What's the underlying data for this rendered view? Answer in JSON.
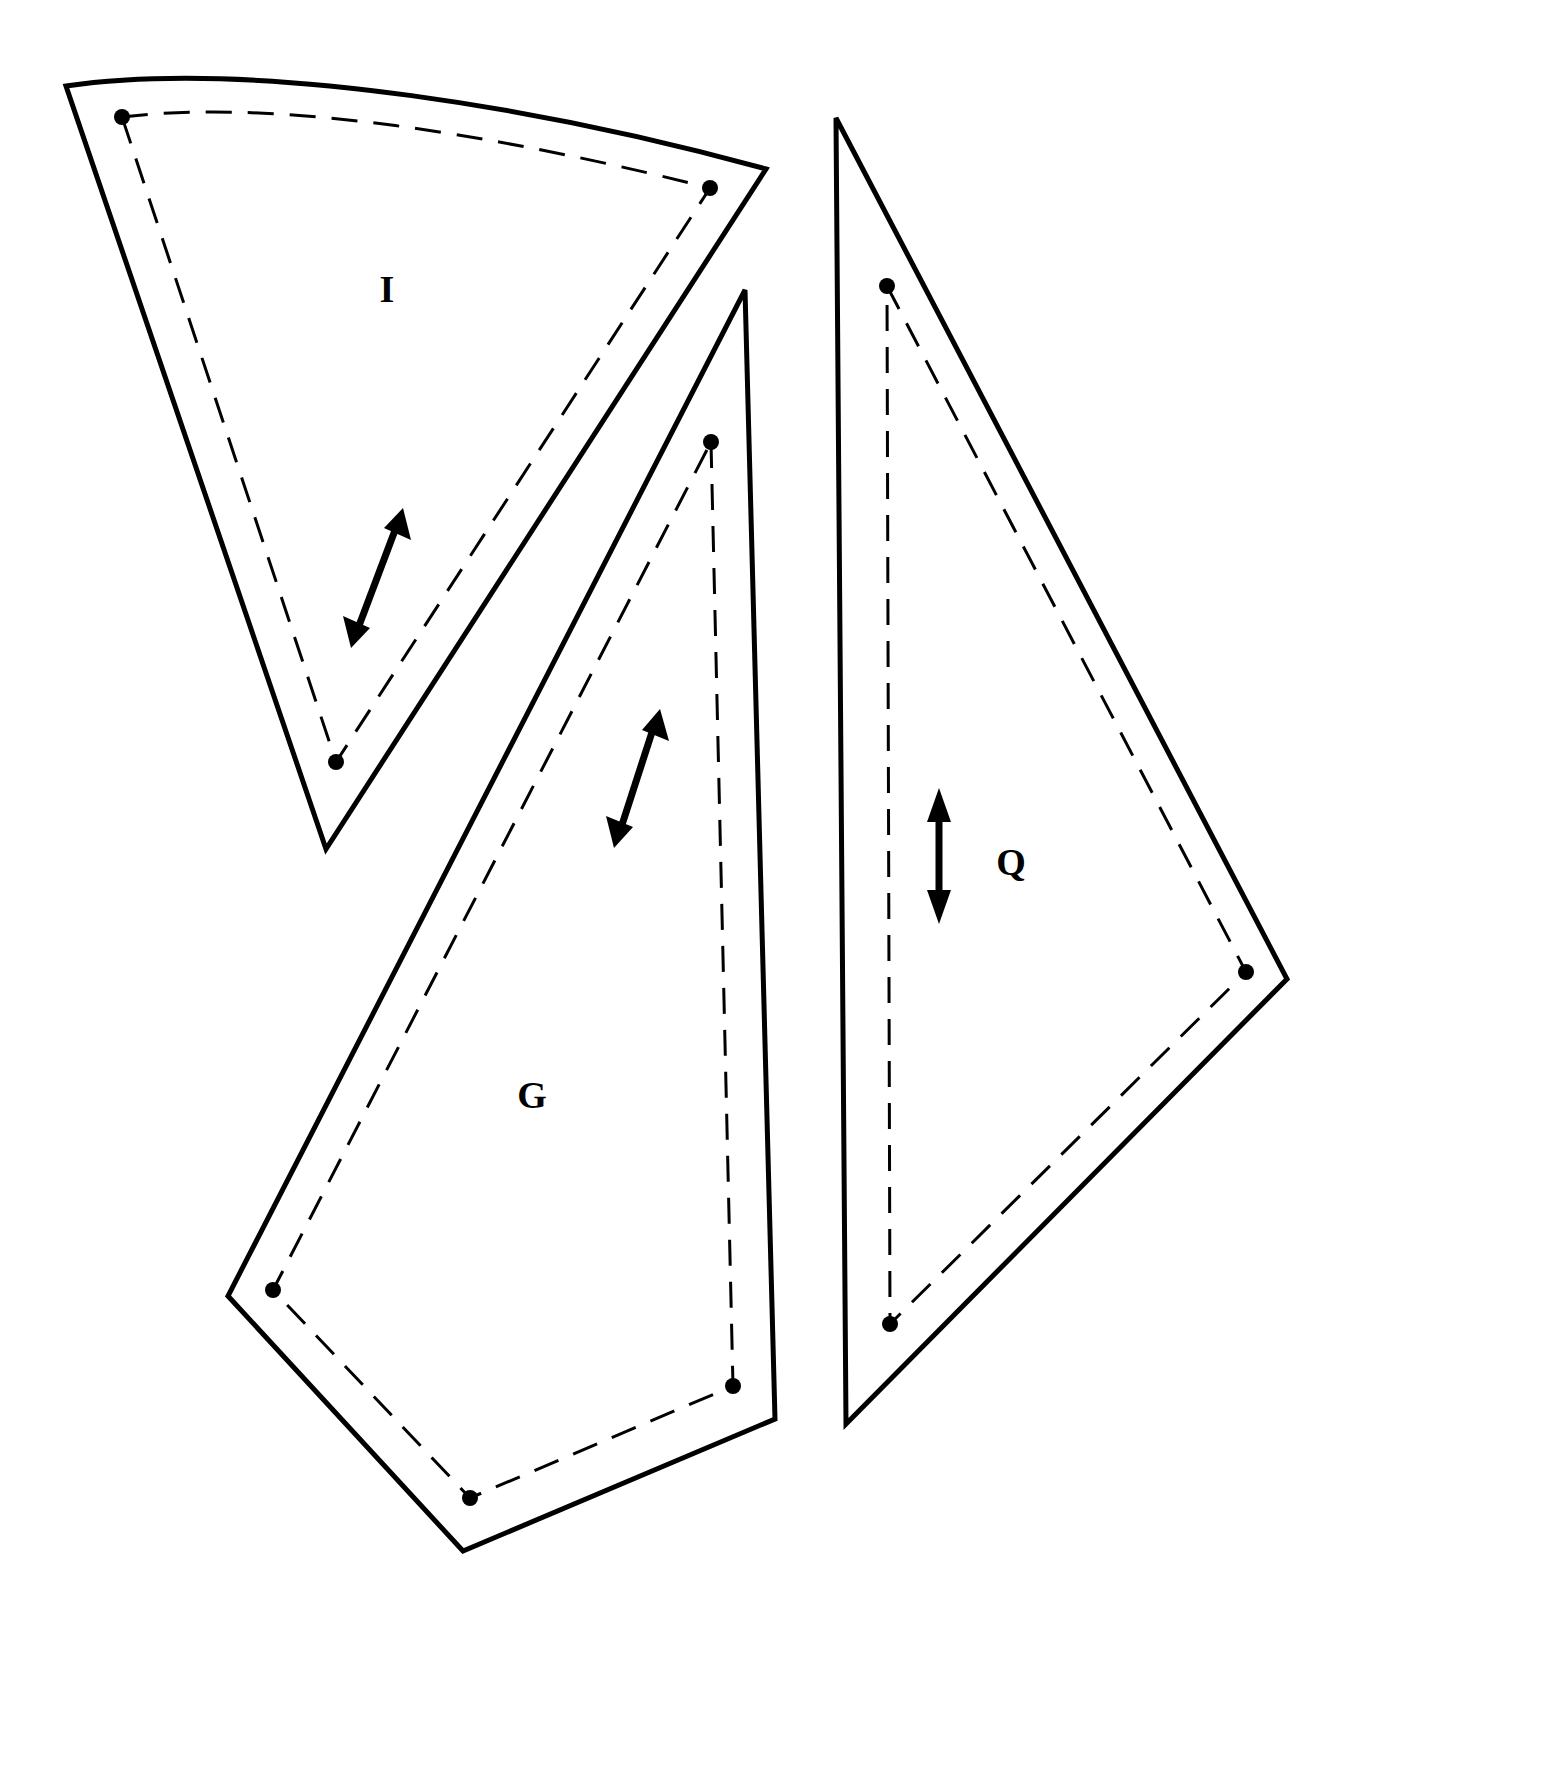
{
  "document": {
    "title": "Sewing Pattern Template Sheet",
    "background_color": "#ffffff",
    "ink_color": "#000000",
    "width": 1568,
    "height": 1790
  },
  "legend": {
    "cut_line_style": "solid",
    "seam_line_style": "dashed",
    "marker_style": "filled-dot",
    "grainline_style": "double-headed-arrow"
  },
  "pieces": [
    {
      "id": "piece-i",
      "label": "I",
      "label_position": {
        "x": 387,
        "y": 293
      },
      "description": "Curved-top wedge / fan segment pattern piece",
      "cut_outline": "M 66,86 C 260,58 560,112 766,169 L 326,849 Z",
      "seam_outline": "M 122,117 C 300,95 560,150 710,188 L 336,762 Z",
      "markers": [
        {
          "x": 122,
          "y": 117
        },
        {
          "x": 710,
          "y": 188
        },
        {
          "x": 336,
          "y": 762
        }
      ],
      "grainline": {
        "x1": 357,
        "y1": 645,
        "x2": 403,
        "y2": 508,
        "double_headed": true
      }
    },
    {
      "id": "piece-g",
      "label": "G",
      "label_position": {
        "x": 532,
        "y": 1099
      },
      "description": "Elongated kite / quadrilateral pattern piece",
      "cut_outline": "M 745,290 L 775,1419 L 463,1551 L 228,1296 Z",
      "seam_outline": "M 711,442 L 733,1386 L 470,1498 L 273,1290 Z",
      "markers": [
        {
          "x": 711,
          "y": 442
        },
        {
          "x": 733,
          "y": 1386
        },
        {
          "x": 470,
          "y": 1498
        },
        {
          "x": 273,
          "y": 1290
        }
      ],
      "grainline": {
        "x1": 620,
        "y1": 845,
        "x2": 660,
        "y2": 709,
        "double_headed": true
      }
    },
    {
      "id": "piece-q",
      "label": "Q",
      "label_position": {
        "x": 1011,
        "y": 866
      },
      "description": "Tall right-leaning triangle pattern piece",
      "cut_outline": "M 836,118 L 1287,979 L 846,1424 Z",
      "seam_outline": "M 887,286 L 1246,972 L 890,1324 Z",
      "markers": [
        {
          "x": 887,
          "y": 286
        },
        {
          "x": 1246,
          "y": 972
        },
        {
          "x": 890,
          "y": 1324
        }
      ],
      "grainline": {
        "x1": 939,
        "y1": 922,
        "x2": 939,
        "y2": 790,
        "double_headed": true
      }
    }
  ]
}
